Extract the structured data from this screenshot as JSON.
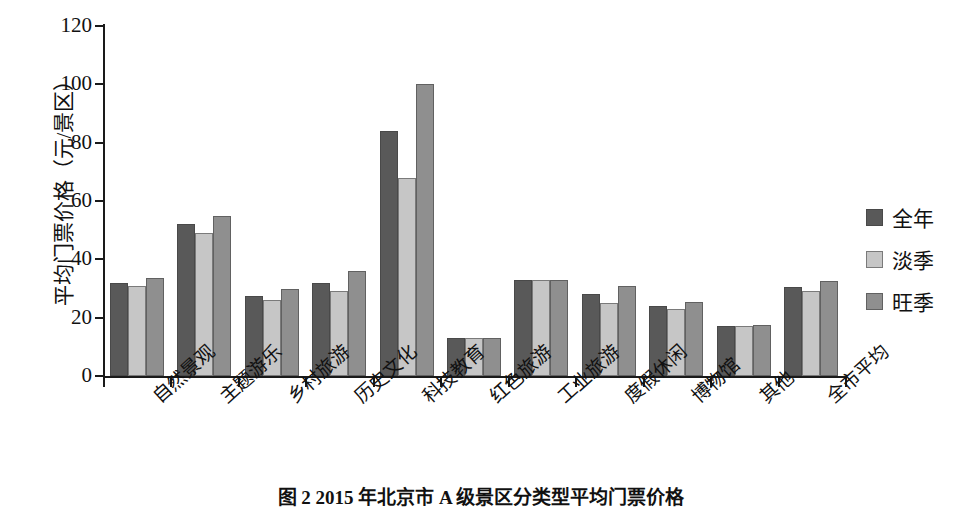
{
  "chart_data": {
    "type": "bar",
    "title": "",
    "caption": "图 2  2015 年北京市 A 级景区分类型平均门票价格",
    "xlabel": "",
    "ylabel": "平均门票价格（元/景区）",
    "ylim": [
      0,
      120
    ],
    "yticks": [
      0,
      20,
      40,
      60,
      80,
      100,
      120
    ],
    "ytick_labels": [
      "0",
      "20",
      "40",
      "60",
      "80",
      "100",
      "120"
    ],
    "grid": false,
    "legend_position": "right",
    "categories": [
      "自然景观",
      "主题游乐",
      "乡村旅游",
      "历史文化",
      "科技教育",
      "红色旅游",
      "工业旅游",
      "度假休闲",
      "博物馆",
      "其他",
      "全市平均"
    ],
    "series": [
      {
        "name": "全年",
        "color": "#595959",
        "values": [
          32,
          52,
          27.5,
          32,
          84,
          13,
          33,
          28,
          24,
          17,
          30.5
        ]
      },
      {
        "name": "淡季",
        "color": "#c6c6c6",
        "values": [
          31,
          49,
          26,
          29,
          68,
          13,
          33,
          25,
          23,
          17,
          29
        ]
      },
      {
        "name": "旺季",
        "color": "#8f8f8f",
        "values": [
          33.5,
          55,
          30,
          36,
          100,
          13,
          33,
          31,
          25.5,
          17.5,
          32.5
        ]
      }
    ]
  },
  "legend": {
    "items": [
      {
        "label": "全年",
        "swatch": "dark-gray-swatch"
      },
      {
        "label": "淡季",
        "swatch": "light-gray-swatch"
      },
      {
        "label": "旺季",
        "swatch": "medium-gray-swatch"
      }
    ]
  }
}
